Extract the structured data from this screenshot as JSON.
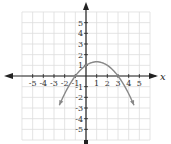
{
  "chart_data": {
    "type": "line",
    "title": "",
    "xlabel": "x",
    "ylabel": "",
    "xlim": [
      -6,
      6
    ],
    "ylim": [
      -6,
      6
    ],
    "grid": true,
    "x_ticks": [
      -5,
      -4,
      -3,
      -2,
      -1,
      1,
      2,
      3,
      4,
      5
    ],
    "y_ticks": [
      5,
      4,
      3,
      2,
      1,
      -1,
      -2,
      -3,
      -4,
      -5
    ],
    "x_tick_labels": [
      "-5",
      "-4",
      "-3",
      "-2",
      "-1",
      "1",
      "2",
      "3",
      "4",
      "5"
    ],
    "y_tick_labels": [
      "5",
      "4",
      "3",
      "2",
      "1",
      "-1",
      "-2",
      "-3",
      "-4",
      "-5"
    ],
    "series": [
      {
        "name": "parabola",
        "equation": "y = -1/3 (x + 1)(x - 3)",
        "x": [
          -2.5,
          -2,
          -1,
          0,
          1,
          2,
          3,
          4,
          4.5
        ],
        "y": [
          -2.75,
          -1.67,
          0,
          1,
          1.33,
          1,
          0,
          -1.67,
          -2.75
        ],
        "roots": [
          -1,
          3
        ],
        "vertex": [
          1,
          1.33
        ],
        "arrows_at_ends": true
      }
    ],
    "colors": {
      "axis": "#222222",
      "grid": "#dddddd",
      "curve": "#888888"
    }
  }
}
